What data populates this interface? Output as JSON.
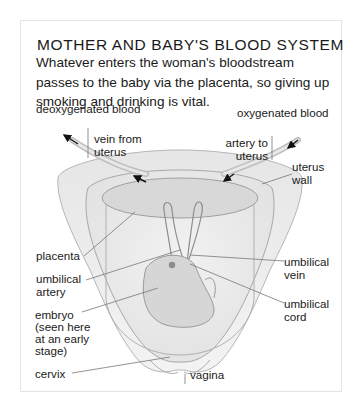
{
  "title": "MOTHER AND BABY'S BLOOD SYSTEM",
  "intro": "Whatever enters the woman's bloodstream passes to the baby via the placenta, so giving up smoking and drinking is vital.",
  "labels": {
    "deoxygenated": "deoxygenated blood",
    "oxygenated": "oxygenated blood",
    "vein_from_uterus_1": "vein from",
    "vein_from_uterus_2": "uterus",
    "artery_to_uterus_1": "artery to",
    "artery_to_uterus_2": "uterus",
    "uterus_wall_1": "uterus",
    "uterus_wall_2": "wall",
    "placenta": "placenta",
    "umbilical_artery_1": "umbilical",
    "umbilical_artery_2": "artery",
    "umbilical_vein_1": "umbilical",
    "umbilical_vein_2": "vein",
    "embryo_1": "embryo",
    "embryo_2": "(seen here",
    "embryo_3": "at an early",
    "embryo_4": "stage)",
    "umbilical_cord_1": "umbilical",
    "umbilical_cord_2": "cord",
    "cervix": "cervix",
    "vagina": "vagina"
  },
  "colors": {
    "tissue_light": "#eeeeee",
    "tissue_mid": "#dcdcdc",
    "tissue_dark": "#c4c4c4",
    "outline": "#9a9a9a",
    "leader_line": "#777777",
    "arrow": "#111111"
  }
}
